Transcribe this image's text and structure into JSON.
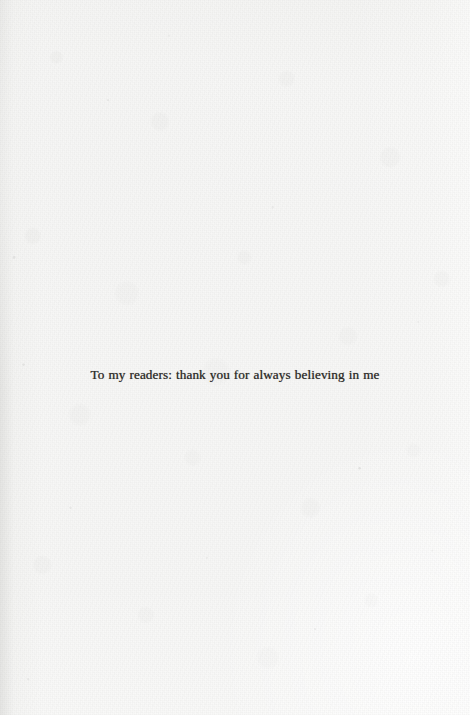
{
  "page": {
    "kind": "book-dedication-page",
    "paper_color": "#f7f7f6",
    "ink_color": "#231f1c"
  },
  "dedication": {
    "text": "To my readers: thank you for always believing in me"
  }
}
